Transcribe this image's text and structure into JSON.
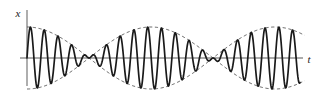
{
  "figure": {
    "name": "beats-waveform",
    "background_color": "#ffffff",
    "curve_color": "#1a1a1a",
    "envelope_color": "#555555",
    "axis_color": "#5a5a5a"
  },
  "axes": {
    "vertical": {
      "label": "x",
      "x_px": 27,
      "y_top_px": 10,
      "y_bottom_px": 86,
      "label_x_px": 18,
      "label_y_px": 15
    },
    "horizontal": {
      "label": "t",
      "y_px": 58,
      "x_left_px": 20,
      "x_right_px": 303,
      "label_x_px": 307,
      "label_y_px": 63
    }
  },
  "chart_data": {
    "type": "line",
    "title": "",
    "xlabel": "t",
    "ylabel": "x",
    "grid": false,
    "legend": null,
    "xlim": [
      0,
      319
    ],
    "ylim": [
      -1.12,
      1.12
    ],
    "origin_px": {
      "x": 27,
      "y": 58
    },
    "amplitude_px": 31,
    "carrier": {
      "name": "modulated oscillation",
      "style": "solid",
      "line_width_px": 1.7,
      "wavelength_px": 13.8,
      "cycles_per_beat": 9,
      "formula": "x(t) = cos(pi*(t-t0)/124) * sin(2*pi*(t-t0)/13.8)"
    },
    "envelope": {
      "name": "amplitude envelope",
      "style": "dashed",
      "dash_pattern": "3.2,2.6",
      "line_width_px": 0.9,
      "beat_period_px": 124,
      "nodes_px": [
        27,
        150,
        273
      ],
      "antinodes_px": [
        88.5,
        211.5
      ],
      "formula_upper": "+|cos(pi*(t-27)/124)|",
      "formula_lower": "-|cos(pi*(t-27)/124)|"
    },
    "x_extent_px": [
      27,
      300
    ]
  }
}
